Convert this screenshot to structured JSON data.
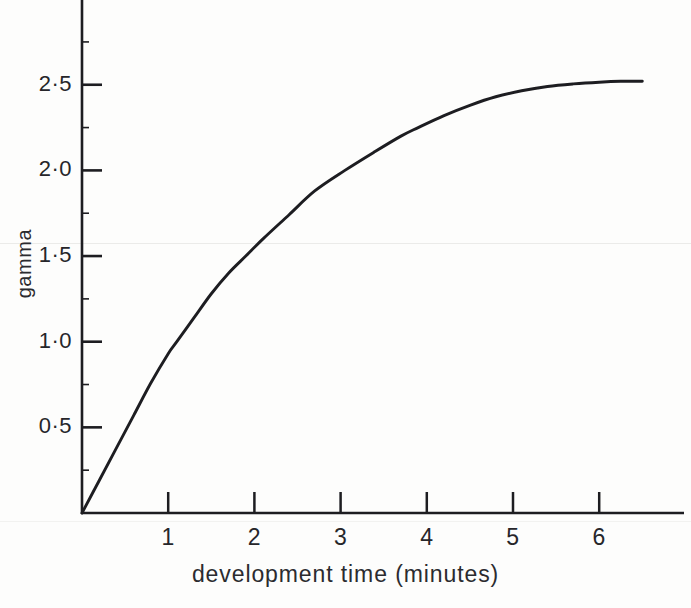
{
  "chart_data": {
    "type": "line",
    "title": "",
    "xlabel": "development time (minutes)",
    "ylabel": "gamma",
    "xlim": [
      0,
      6.95
    ],
    "ylim": [
      0,
      2.92
    ],
    "grid": false,
    "legend": null,
    "x_ticks": [
      "1",
      "2",
      "3",
      "4",
      "5",
      "6"
    ],
    "x_tick_values": [
      1,
      2,
      3,
      4,
      5,
      6
    ],
    "y_ticks": [
      "0·5",
      "1·0",
      "1·5",
      "2·0",
      "2·5"
    ],
    "y_tick_values": [
      0.5,
      1.0,
      1.5,
      2.0,
      2.5
    ],
    "x_minor_ticks": [],
    "y_minor_ticks": [
      0.25,
      0.75,
      1.25,
      1.75,
      2.25,
      2.75
    ],
    "series": [
      {
        "name": "gamma vs development time",
        "color": "#1d1d21",
        "x": [
          0.0,
          0.2,
          0.4,
          0.6,
          0.8,
          1.0,
          1.1,
          1.3,
          1.5,
          1.7,
          1.9,
          2.1,
          2.4,
          2.7,
          3.05,
          3.4,
          3.7,
          3.9,
          4.2,
          4.5,
          4.8,
          5.1,
          5.4,
          5.7,
          6.0,
          6.25,
          6.5
        ],
        "y": [
          0.0,
          0.19,
          0.38,
          0.57,
          0.76,
          0.93,
          1.0,
          1.14,
          1.28,
          1.4,
          1.5,
          1.6,
          1.74,
          1.88,
          2.0,
          2.11,
          2.2,
          2.25,
          2.32,
          2.38,
          2.43,
          2.465,
          2.49,
          2.505,
          2.515,
          2.52,
          2.52
        ]
      }
    ],
    "asymptote": 2.52
  },
  "axis": {
    "y_title": "gamma",
    "x_title": "development time (minutes)"
  },
  "caption": ""
}
